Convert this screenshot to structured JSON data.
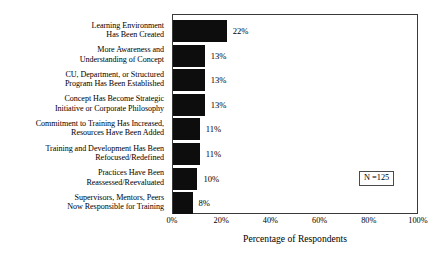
{
  "chart_data": {
    "type": "bar",
    "orientation": "horizontal",
    "title": "",
    "xlabel": "Percentage of Respondents",
    "ylabel": "",
    "xlim": [
      0,
      100
    ],
    "xticks": [
      "0%",
      "20%",
      "40%",
      "60%",
      "80%",
      "100%"
    ],
    "xtick_values": [
      0,
      20,
      40,
      60,
      80,
      100
    ],
    "grid": false,
    "legend": null,
    "bar_color": "#0d0d0d",
    "annotation": "N =125",
    "categories": [
      "Learning Environment Has Been Created",
      "More Awareness and Understanding of Concept",
      "CU, Department, or Structured Program Has Been Established",
      "Concept Has Become Strategic Initiative or Corporate Philosophy",
      "Commitment to Training Has Increased, Resources Have Been Added",
      "Training and Development Has Been Refocused/Redefined",
      "Practices Have Been Reassessed/Reevaluated",
      "Supervisors, Mentors, Peers Now Responsible for Training"
    ],
    "category_lines": [
      [
        "Learning Environment",
        "Has Been Created"
      ],
      [
        "More Awareness and",
        "Understanding of Concept"
      ],
      [
        "CU, Department, or Structured",
        "Program Has Been Established"
      ],
      [
        "Concept Has Become Strategic",
        "Initiative or Corporate Philosophy"
      ],
      [
        "Commitment to Training Has Increased,",
        "Resources Have Been Added"
      ],
      [
        "Training and Development Has Been",
        "Refocused/Redefined"
      ],
      [
        "Practices Have Been",
        "Reassessed/Reevaluated"
      ],
      [
        "Supervisors, Mentors, Peers",
        "Now Responsible for Training"
      ]
    ],
    "values": [
      22,
      13,
      13,
      13,
      11,
      11,
      10,
      8
    ],
    "value_labels": [
      "22%",
      "13%",
      "13%",
      "13%",
      "11%",
      "11%",
      "10%",
      "8%"
    ]
  }
}
